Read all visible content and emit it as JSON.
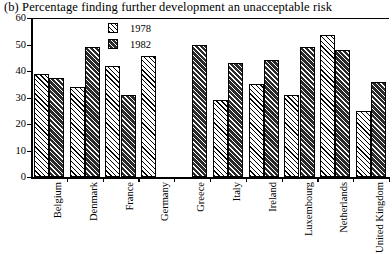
{
  "chart_data": {
    "type": "bar",
    "title": "(b) Percentage finding further development an unacceptable risk",
    "xlabel": "",
    "ylabel": "",
    "ylim": [
      0,
      60
    ],
    "yticks": [
      0,
      10,
      20,
      30,
      40,
      50,
      60
    ],
    "ytick_labels": [
      "0",
      "10",
      "20",
      "30",
      "40",
      "50",
      "60"
    ],
    "grid": false,
    "legend_position": "top-center",
    "categories": [
      "Belgium",
      "Denmark",
      "France",
      "Germany",
      "Greece",
      "Italy",
      "Ireland",
      "Luxembourg",
      "Netherlands",
      "United Kingdom"
    ],
    "series": [
      {
        "name": "1978",
        "color": "#ffffff",
        "values": [
          39,
          34,
          42,
          45.5,
          null,
          29,
          35,
          31,
          53.5,
          25
        ]
      },
      {
        "name": "1982",
        "color": "#2b2b2b",
        "values": [
          37.5,
          49,
          31,
          null,
          50,
          43,
          44,
          49,
          48,
          36
        ]
      }
    ]
  },
  "legend": {
    "items": [
      {
        "label": "1978",
        "swatch": "hatch-light-swatch"
      },
      {
        "label": "1982",
        "swatch": "hatch-dark-swatch"
      }
    ]
  }
}
